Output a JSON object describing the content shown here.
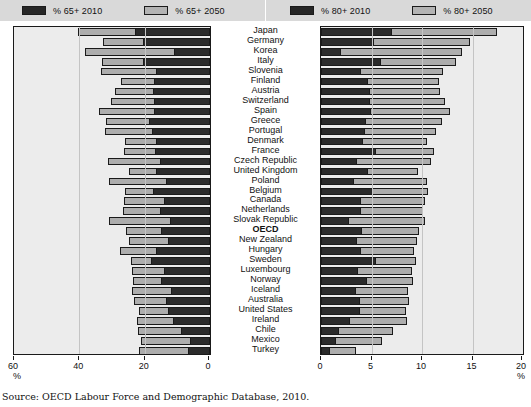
{
  "source_note": "Source: OECD Labour Force and Demographic Database, 2010.",
  "colors": {
    "dark": "#2b2b2b",
    "light": "#adadad",
    "legend_bg": "#d9d9d9",
    "plot_bg": "#ececec"
  },
  "legend_left": [
    {
      "label": "% 65+ 2010",
      "swatch": "dark"
    },
    {
      "label": "% 65+ 2050",
      "swatch": "light"
    }
  ],
  "legend_right": [
    {
      "label": "% 80+ 2010",
      "swatch": "dark"
    },
    {
      "label": "% 80+ 2050",
      "swatch": "light"
    }
  ],
  "axis_left": {
    "unit": "%",
    "ticks": [
      60,
      40,
      20,
      0
    ],
    "tick_labels": [
      "60",
      "40",
      "20",
      "0"
    ],
    "reversed": true
  },
  "axis_right": {
    "unit": "%",
    "ticks": [
      0,
      5,
      10,
      15,
      20
    ],
    "tick_labels": [
      "0",
      "5",
      "10",
      "15",
      "20"
    ],
    "reversed": false
  },
  "countries": [
    "Japan",
    "Germany",
    "Korea",
    "Italy",
    "Slovenia",
    "Finland",
    "Austria",
    "Switzerland",
    "Spain",
    "Greece",
    "Portugal",
    "Denmark",
    "France",
    "Czech Republic",
    "United Kingdom",
    "Poland",
    "Belgium",
    "Canada",
    "Netherlands",
    "Slovak Republic",
    "OECD",
    "New Zealand",
    "Hungary",
    "Sweden",
    "Luxembourg",
    "Norway",
    "Iceland",
    "Australia",
    "United States",
    "Ireland",
    "Chile",
    "Mexico",
    "Turkey"
  ],
  "bold_countries": [
    "OECD"
  ],
  "chart_data": [
    {
      "type": "bar",
      "orientation": "horizontal",
      "stacked": false,
      "title": "",
      "xlabel": "%",
      "ylabel": "",
      "xlim": [
        0,
        60
      ],
      "x_reversed": true,
      "grid": true,
      "legend_position": "top",
      "categories": [
        "Japan",
        "Germany",
        "Korea",
        "Italy",
        "Slovenia",
        "Finland",
        "Austria",
        "Switzerland",
        "Spain",
        "Greece",
        "Portugal",
        "Denmark",
        "France",
        "Czech Republic",
        "United Kingdom",
        "Poland",
        "Belgium",
        "Canada",
        "Netherlands",
        "Slovak Republic",
        "OECD",
        "New Zealand",
        "Hungary",
        "Sweden",
        "Luxembourg",
        "Norway",
        "Iceland",
        "Australia",
        "United States",
        "Ireland",
        "Chile",
        "Mexico",
        "Turkey"
      ],
      "series": [
        {
          "name": "% 65+ 2010",
          "values": [
            23.0,
            20.5,
            11.1,
            20.4,
            16.6,
            17.2,
            17.6,
            17.0,
            17.1,
            18.6,
            17.9,
            16.6,
            16.8,
            15.3,
            16.5,
            13.5,
            17.3,
            14.2,
            15.4,
            12.3,
            14.9,
            13.0,
            16.5,
            18.2,
            14.0,
            15.0,
            12.0,
            13.5,
            13.0,
            11.3,
            9.0,
            6.2,
            6.8
          ]
        },
        {
          "name": "% 65+ 2050",
          "values": [
            40.4,
            32.7,
            38.2,
            33.0,
            33.4,
            27.2,
            29.0,
            30.4,
            34.1,
            31.7,
            32.0,
            26.0,
            26.2,
            31.1,
            24.7,
            31.0,
            26.0,
            26.3,
            26.5,
            31.0,
            25.7,
            24.7,
            27.7,
            24.2,
            24.0,
            23.5,
            24.0,
            23.2,
            21.6,
            22.3,
            22.0,
            21.0,
            21.6
          ]
        }
      ]
    },
    {
      "type": "bar",
      "orientation": "horizontal",
      "stacked": false,
      "title": "",
      "xlabel": "%",
      "ylabel": "",
      "xlim": [
        0,
        20
      ],
      "x_reversed": false,
      "grid": true,
      "legend_position": "top",
      "categories": [
        "Japan",
        "Germany",
        "Korea",
        "Italy",
        "Slovenia",
        "Finland",
        "Austria",
        "Switzerland",
        "Spain",
        "Greece",
        "Portugal",
        "Denmark",
        "France",
        "Czech Republic",
        "United Kingdom",
        "Poland",
        "Belgium",
        "Canada",
        "Netherlands",
        "Slovak Republic",
        "OECD",
        "New Zealand",
        "Hungary",
        "Sweden",
        "Luxembourg",
        "Norway",
        "Iceland",
        "Australia",
        "United States",
        "Ireland",
        "Chile",
        "Mexico",
        "Turkey"
      ],
      "series": [
        {
          "name": "% 80+ 2010",
          "values": [
            6.9,
            5.1,
            1.9,
            5.8,
            3.9,
            4.6,
            4.8,
            4.8,
            4.9,
            4.4,
            4.3,
            4.1,
            5.3,
            3.5,
            4.6,
            3.2,
            5.0,
            3.9,
            3.9,
            2.7,
            4.0,
            3.5,
            3.9,
            5.3,
            3.6,
            4.5,
            3.4,
            3.8,
            3.8,
            2.8,
            1.7,
            1.4,
            0.8
          ]
        },
        {
          "name": "% 80+ 2050",
          "values": [
            17.4,
            14.8,
            14.0,
            13.4,
            12.1,
            11.7,
            11.8,
            12.3,
            12.8,
            12.0,
            11.4,
            10.5,
            11.2,
            10.9,
            9.6,
            10.5,
            10.6,
            10.3,
            10.1,
            10.3,
            9.7,
            9.5,
            9.2,
            9.4,
            9.0,
            9.1,
            8.6,
            8.7,
            8.4,
            8.5,
            7.1,
            6.0,
            3.5
          ]
        }
      ]
    }
  ]
}
